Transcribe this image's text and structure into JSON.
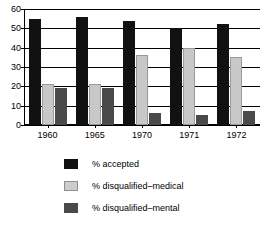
{
  "chart_data": {
    "type": "bar",
    "title": "",
    "subtitle": "",
    "xlabel": "",
    "ylabel": "",
    "categories": [
      "1960",
      "1965",
      "1970",
      "1971",
      "1972"
    ],
    "series": [
      {
        "name": "% accepted",
        "color": "#111111",
        "values": [
          55,
          56,
          54,
          50,
          52
        ]
      },
      {
        "name": "% disqualified–medical",
        "color": "#cccccc",
        "values": [
          21,
          21,
          36,
          40,
          35
        ]
      },
      {
        "name": "% disqualified–mental",
        "color": "#4a4a4a",
        "values": [
          19,
          19,
          6,
          5,
          7
        ]
      }
    ],
    "ylim": [
      0,
      60
    ],
    "yticks": [
      0,
      10,
      20,
      30,
      40,
      50,
      60
    ],
    "ytick_labels": [
      "0",
      "10",
      "20",
      "30",
      "40",
      "50",
      "60"
    ],
    "grid": true,
    "grid_axis": "y",
    "legend_position": "below",
    "bar_group_order": [
      "% accepted",
      "% disqualified–medical",
      "% disqualified–mental"
    ]
  },
  "legend": {
    "entries": [
      {
        "label": "% accepted"
      },
      {
        "label": "% disqualified–medical"
      },
      {
        "label": "% disqualified–mental"
      }
    ]
  }
}
